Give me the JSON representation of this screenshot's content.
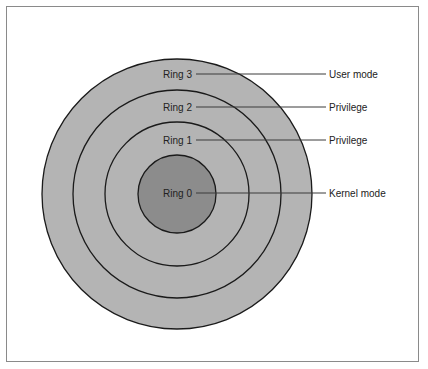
{
  "diagram": {
    "type": "concentric-rings",
    "colors": {
      "ring_fill": "#b4b4b4",
      "core_fill": "#8c8c8c",
      "stroke": "#1a1a1a",
      "leader": "#3a3a3a",
      "frame": "#8a8a8a"
    },
    "rings": [
      {
        "label": "Ring 3",
        "description": "User mode"
      },
      {
        "label": "Ring 2",
        "description": "Privilege"
      },
      {
        "label": "Ring 1",
        "description": "Privilege"
      },
      {
        "label": "Ring 0",
        "description": "Kernel mode"
      }
    ]
  }
}
